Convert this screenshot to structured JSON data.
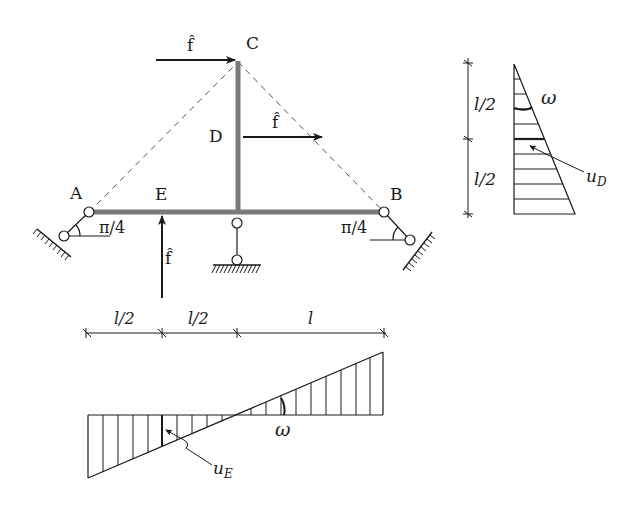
{
  "figure": {
    "type": "structural-frame-with-influence-diagrams",
    "colors": {
      "ink": "#1a1a1a",
      "member": "#7a7a7a",
      "dashed": "#555555",
      "background": "#ffffff"
    }
  },
  "frame": {
    "nodes": {
      "A": {
        "label": "A"
      },
      "B": {
        "label": "B"
      },
      "C": {
        "label": "C"
      },
      "D": {
        "label": "D"
      },
      "E": {
        "label": "E"
      }
    },
    "angles": {
      "left": "π/4",
      "right": "π/4"
    },
    "loads": {
      "at_C": {
        "label": "f̂",
        "direction": "right"
      },
      "at_D": {
        "label": "f̂",
        "direction": "right"
      },
      "at_E": {
        "label": "f̂",
        "direction": "up"
      }
    }
  },
  "dimensions_horizontal": {
    "segments": [
      "l/2",
      "l/2",
      "l"
    ]
  },
  "dimensions_vertical": {
    "segments": [
      "l/2",
      "l/2"
    ]
  },
  "vertical_diagram": {
    "rotation_label": "ω",
    "displacement_label": "u",
    "displacement_sub": "D"
  },
  "horizontal_diagram": {
    "rotation_label": "ω",
    "displacement_label": "u",
    "displacement_sub": "E"
  }
}
